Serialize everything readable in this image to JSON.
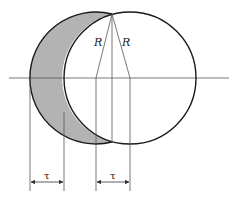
{
  "diagram": {
    "labels": {
      "radius_left": "R",
      "radius_right": "R",
      "offset_left": "τ",
      "offset_right": "τ"
    },
    "colors": {
      "stroke": "#1a1a1a",
      "thin_line": "#555555",
      "shaded": "#b3b3b3",
      "background": "#ffffff"
    }
  }
}
